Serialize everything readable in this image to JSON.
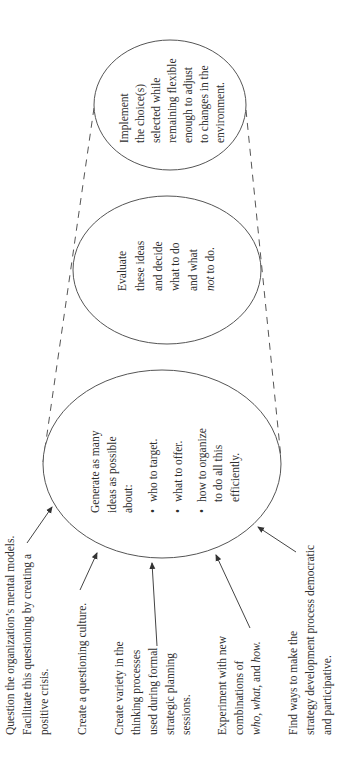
{
  "diagram": {
    "orientation": "rotated -90 degrees (reads bottom-to-top)",
    "stages": [
      {
        "id": "generate",
        "lines": [
          "Generate as many",
          "ideas as possible",
          "about:"
        ],
        "bullets": [
          {
            "lines": [
              "who to target."
            ]
          },
          {
            "lines": [
              "what to offer."
            ]
          },
          {
            "lines": [
              "how to organize",
              "to do all this",
              "efficiently."
            ]
          }
        ]
      },
      {
        "id": "evaluate",
        "lines": [
          "Evaluate",
          "these ideas",
          "and decide",
          "what to do",
          "and what"
        ],
        "last_line_italic": "not",
        "last_line_rest": " to do."
      },
      {
        "id": "implement",
        "lines": [
          "Implement",
          "the choice(s)",
          "selected while",
          "remaining flexible",
          "enough to adjust",
          "to changes in the",
          "environment."
        ]
      }
    ],
    "inputs": [
      {
        "id": "question",
        "lines": [
          "Question the organization’s mental models.",
          "Facilitate this questioning by creating a",
          "positive crisis."
        ]
      },
      {
        "id": "culture",
        "lines": [
          "Create a questioning culture."
        ]
      },
      {
        "id": "variety",
        "lines": [
          "Create variety in the",
          "thinking processes",
          "used during formal",
          "strategic planning",
          "sessions."
        ]
      },
      {
        "id": "experiment",
        "lines": [
          "Experiment with new",
          "combinations of"
        ],
        "last_line_parts": [
          {
            "t": "who,",
            "i": true
          },
          {
            "t": " ",
            "i": false
          },
          {
            "t": "what,",
            "i": true
          },
          {
            "t": " and ",
            "i": false
          },
          {
            "t": "how.",
            "i": true
          }
        ]
      },
      {
        "id": "democratic",
        "lines": [
          "Find ways to make the",
          "strategy development process democratic",
          "and participative."
        ]
      }
    ],
    "bullet_char": "•",
    "colors": {
      "stroke": "#555555",
      "text": "#2e2e2e",
      "background": "#ffffff"
    }
  }
}
